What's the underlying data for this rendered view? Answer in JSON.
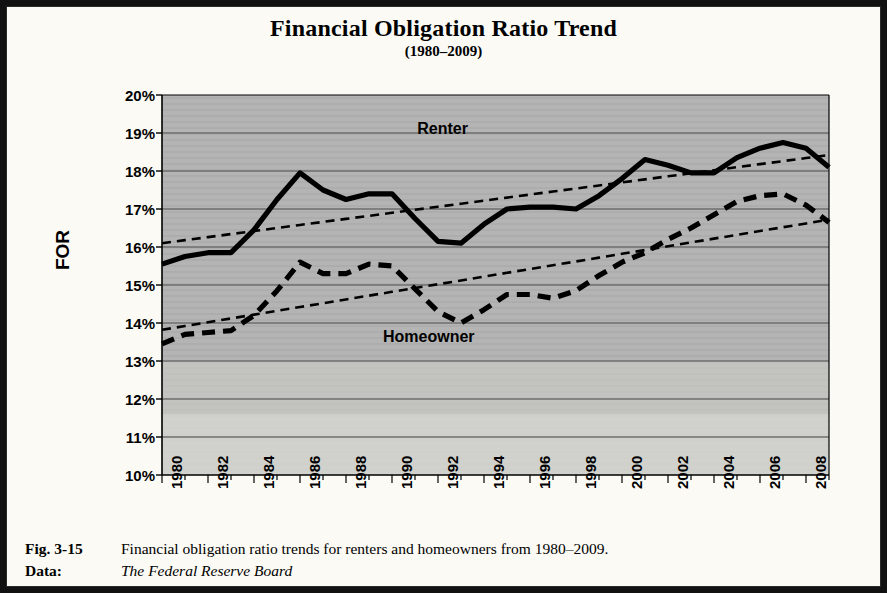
{
  "chart_data": {
    "type": "line",
    "title": "Financial Obligation Ratio Trend",
    "subtitle": "(1980–2009)",
    "xlabel": "",
    "ylabel": "FOR",
    "ylim": [
      10,
      20
    ],
    "xlim": [
      1980,
      2009
    ],
    "ytick_labels": [
      "20%",
      "19%",
      "18%",
      "17%",
      "16%",
      "15%",
      "14%",
      "13%",
      "12%",
      "11%",
      "10%"
    ],
    "ytick_values": [
      20,
      19,
      18,
      17,
      16,
      15,
      14,
      13,
      12,
      11,
      10
    ],
    "xtick_labels": [
      "1980",
      "1982",
      "1984",
      "1986",
      "1988",
      "1990",
      "1992",
      "1994",
      "1996",
      "1998",
      "2000",
      "2002",
      "2004",
      "2006",
      "2008"
    ],
    "xtick_values": [
      1980,
      1982,
      1984,
      1986,
      1988,
      1990,
      1992,
      1994,
      1996,
      1998,
      2000,
      2002,
      2004,
      2006,
      2008
    ],
    "grid": true,
    "legend": "inline-annotations",
    "plot_background": "#b4b4b4",
    "line_color": "#000000",
    "x": [
      1980,
      1981,
      1982,
      1983,
      1984,
      1985,
      1986,
      1987,
      1988,
      1989,
      1990,
      1991,
      1992,
      1993,
      1994,
      1995,
      1996,
      1997,
      1998,
      1999,
      2000,
      2001,
      2002,
      2003,
      2004,
      2005,
      2006,
      2007,
      2008,
      2009
    ],
    "series": [
      {
        "name": "Renter",
        "style": "solid-thick",
        "values": [
          15.55,
          15.75,
          15.85,
          15.85,
          16.45,
          17.25,
          17.95,
          17.5,
          17.25,
          17.4,
          17.4,
          16.75,
          16.15,
          16.1,
          16.6,
          17.0,
          17.05,
          17.05,
          17.0,
          17.35,
          17.8,
          18.3,
          18.15,
          17.95,
          17.95,
          18.35,
          18.6,
          18.75,
          18.6,
          18.1
        ]
      },
      {
        "name": "Homeowner",
        "style": "dashed-thick",
        "values": [
          13.45,
          13.7,
          13.75,
          13.8,
          14.2,
          14.85,
          15.6,
          15.3,
          15.3,
          15.55,
          15.5,
          14.9,
          14.3,
          14.0,
          14.35,
          14.75,
          14.75,
          14.65,
          14.85,
          15.25,
          15.6,
          15.85,
          16.2,
          16.5,
          16.85,
          17.2,
          17.35,
          17.4,
          17.1,
          16.65
        ]
      },
      {
        "name": "Renter trend",
        "style": "dotted-thin",
        "values": [
          16.1,
          16.18,
          16.26,
          16.34,
          16.42,
          16.5,
          16.58,
          16.66,
          16.74,
          16.82,
          16.9,
          16.98,
          17.06,
          17.14,
          17.22,
          17.3,
          17.38,
          17.46,
          17.54,
          17.62,
          17.7,
          17.78,
          17.86,
          17.94,
          18.02,
          18.1,
          18.18,
          18.26,
          18.34,
          18.42
        ]
      },
      {
        "name": "Homeowner trend",
        "style": "dotted-thin",
        "values": [
          13.82,
          13.92,
          14.02,
          14.12,
          14.22,
          14.32,
          14.42,
          14.52,
          14.62,
          14.72,
          14.82,
          14.92,
          15.02,
          15.12,
          15.22,
          15.32,
          15.42,
          15.52,
          15.62,
          15.72,
          15.82,
          15.92,
          16.02,
          16.12,
          16.22,
          16.32,
          16.42,
          16.52,
          16.62,
          16.72
        ]
      }
    ],
    "annotations": [
      {
        "text": "Renter",
        "x": 1992.2,
        "y": 19.1
      },
      {
        "text": "Homeowner",
        "x": 1991.6,
        "y": 13.62
      }
    ]
  },
  "caption": {
    "figure_key": "Fig. 3-15",
    "figure_text": "Financial obligation ratio trends for renters and homeowners from 1980–2009.",
    "data_key": "Data:",
    "data_text": "The Federal Reserve Board"
  }
}
